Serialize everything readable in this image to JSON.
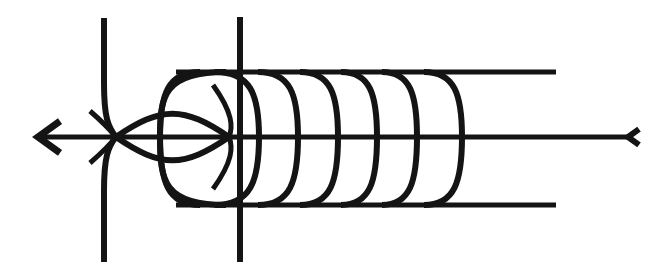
{
  "figure": {
    "caption": "",
    "type": "line-diagram",
    "width": 653,
    "height": 277,
    "background_color": "#ffffff",
    "ink_color": "#141414"
  },
  "chart_data": {
    "type": "line",
    "title": "",
    "subtitle": "",
    "xlabel": "",
    "ylabel": "",
    "grid": false,
    "legend_position": "none",
    "xlim": [
      0,
      653
    ],
    "ylim": [
      277,
      0
    ],
    "axes": {
      "horizontal_axis": {
        "y": 137,
        "x_start": 38,
        "x_end": 628,
        "stroke_width": 5
      },
      "vertical_axis": {
        "x": 240,
        "y_start": 17,
        "y_end": 262,
        "stroke_width": 6
      }
    },
    "arrowheads": [
      {
        "name": "left-arrowhead",
        "x": 38,
        "y": 137,
        "direction": "left",
        "size": 22,
        "stroke_width": 7
      },
      {
        "name": "right-arrowhead",
        "x": 628,
        "y": 137,
        "direction": "left",
        "size": 11,
        "stroke_width": 6
      }
    ],
    "nodes": [
      {
        "name": "left-node",
        "x": 116,
        "y": 137
      },
      {
        "name": "right-node",
        "x": 229,
        "y": 137
      }
    ],
    "asymptotes": [
      {
        "name": "upper-asymptote",
        "y": 72,
        "x_start": 176,
        "x_end": 556,
        "stroke_width": 5
      },
      {
        "name": "lower-asymptote",
        "y": 205,
        "x_start": 176,
        "x_end": 556,
        "stroke_width": 5
      }
    ],
    "left_branch": {
      "name": "left-hyperbolic-branch",
      "x_straight": 104,
      "y_top": 18,
      "y_bottom": 262,
      "node_x": 116,
      "node_y": 137,
      "stroke_width": 6
    },
    "lens_loop": {
      "name": "lens-loop",
      "left_node_x": 116,
      "right_node_x": 229,
      "center_y": 137,
      "half_height": 31,
      "stroke_width": 6
    },
    "series": [
      {
        "name": "arc-1",
        "apex_x": 160,
        "top_x": 200,
        "bottom_x": 200,
        "stroke_width": 6
      },
      {
        "name": "arc-2",
        "apex_x": 259,
        "top_x": 215,
        "bottom_x": 215,
        "stroke_width": 6
      },
      {
        "name": "arc-3",
        "apex_x": 298,
        "top_x": 258,
        "bottom_x": 258,
        "stroke_width": 6
      },
      {
        "name": "arc-4",
        "apex_x": 338,
        "top_x": 300,
        "bottom_x": 300,
        "stroke_width": 6
      },
      {
        "name": "arc-5",
        "apex_x": 377,
        "top_x": 341,
        "bottom_x": 341,
        "stroke_width": 6
      },
      {
        "name": "arc-6",
        "apex_x": 417,
        "top_x": 382,
        "bottom_x": 382,
        "stroke_width": 6
      },
      {
        "name": "arc-7",
        "apex_x": 462,
        "top_x": 424,
        "bottom_x": 424,
        "stroke_width": 6
      }
    ],
    "series_count": 7
  }
}
